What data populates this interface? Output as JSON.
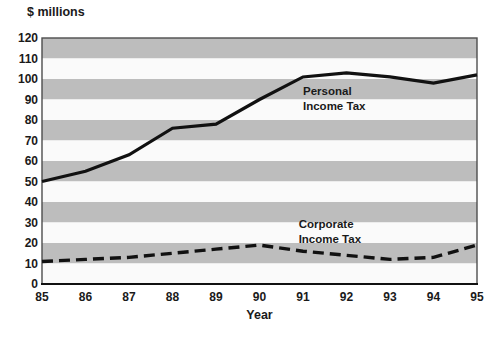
{
  "chart_data": {
    "type": "line",
    "title": "",
    "ylabel": "$ millions",
    "xlabel": "Year",
    "categories": [
      "85",
      "86",
      "87",
      "88",
      "89",
      "90",
      "91",
      "92",
      "93",
      "94",
      "95"
    ],
    "series": [
      {
        "name": "Personal Income Tax",
        "line_style": "solid",
        "values": [
          50,
          55,
          63,
          76,
          78,
          90,
          101,
          103,
          101,
          98,
          102
        ]
      },
      {
        "name": "Corporate Income Tax",
        "line_style": "dashed",
        "values": [
          11,
          12,
          13,
          15,
          17,
          19,
          16,
          14,
          12,
          13,
          19
        ]
      }
    ],
    "annotations": [
      {
        "text": "Personal\nIncome Tax",
        "year": 91.0,
        "value": 97.5
      },
      {
        "text": "Corporate\nIncome Tax",
        "year": 90.9,
        "value": 32.5
      }
    ],
    "ylim": [
      0,
      120
    ],
    "ytick_step": 10,
    "yticks": [
      120,
      110,
      100,
      90,
      80,
      70,
      60,
      50,
      40,
      30,
      20,
      10,
      0
    ],
    "grid": "striped-horizontal-bands",
    "legend": "inline-annotations",
    "colors": {
      "band_dark": "#bdbdbd",
      "band_light": "#fafafa",
      "line": "#111111",
      "text": "#1a1a1a",
      "border": "#4d4d4d",
      "axis": "#111111",
      "background": "#ffffff"
    }
  }
}
